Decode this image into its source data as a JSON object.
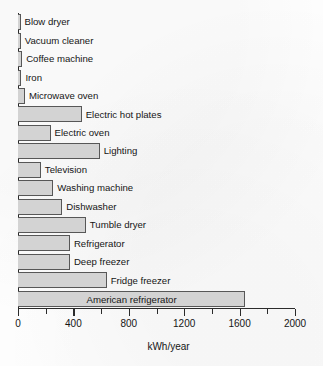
{
  "chart_data": {
    "type": "bar",
    "orientation": "horizontal",
    "title": "",
    "xlabel": "kWh/year",
    "ylabel": "",
    "xlim": [
      0,
      2000
    ],
    "grid": false,
    "legend": false,
    "legend_position": "none",
    "major_ticks": [
      0,
      400,
      800,
      1200,
      1600,
      2000
    ],
    "minor_ticks": [
      200,
      600,
      1000,
      1400,
      1800
    ],
    "tick_labels": [
      "0",
      "400",
      "800",
      "1200",
      "1600",
      "2000"
    ],
    "bar_fill_color": "#d3d3d3",
    "bar_border_color": "#575757",
    "axis_color": "#2b2b2b",
    "background_color": "#ffffff",
    "categories": [
      "Blow dryer",
      "Vacuum cleaner",
      "Coffee machine",
      "Iron",
      "Microwave oven",
      "Electric hot plates",
      "Electric oven",
      "Lighting",
      "Television",
      "Washing machine",
      "Dishwasher",
      "Tumble dryer",
      "Refrigerator",
      "Deep freezer",
      "Fridge freezer",
      "American refrigerator"
    ],
    "values": [
      15,
      20,
      30,
      25,
      50,
      460,
      235,
      590,
      165,
      255,
      320,
      490,
      375,
      375,
      640,
      1640
    ],
    "label_placement": [
      "outside",
      "outside",
      "outside",
      "outside",
      "outside",
      "outside",
      "outside",
      "outside",
      "outside",
      "outside",
      "outside",
      "outside",
      "outside",
      "outside",
      "outside",
      "inside"
    ]
  }
}
